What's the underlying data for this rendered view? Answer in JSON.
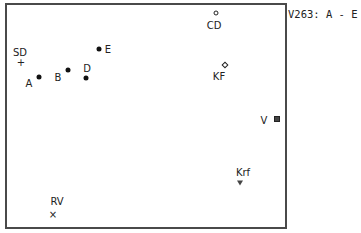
{
  "chart_data": {
    "type": "scatter",
    "title": "V263: A - E",
    "xlabel": "",
    "ylabel": "",
    "grid": false,
    "legend": "none",
    "axes_ticks": "none",
    "points": [
      {
        "label": "SD",
        "marker": "plus",
        "px": [
          21,
          63
        ],
        "label_px": [
          20,
          53
        ]
      },
      {
        "label": "A",
        "marker": "dot",
        "px": [
          39,
          77
        ],
        "label_px": [
          29,
          84
        ]
      },
      {
        "label": "B",
        "marker": "dot",
        "px": [
          68,
          70
        ],
        "label_px": [
          58,
          78
        ]
      },
      {
        "label": "D",
        "marker": "dot",
        "px": [
          86,
          78
        ],
        "label_px": [
          87,
          69
        ]
      },
      {
        "label": "E",
        "marker": "dot",
        "px": [
          99,
          49
        ],
        "label_px": [
          108,
          50
        ]
      },
      {
        "label": "CD",
        "marker": "circle",
        "px": [
          216,
          13
        ],
        "label_px": [
          214,
          26
        ]
      },
      {
        "label": "KF",
        "marker": "diamond",
        "px": [
          225,
          65
        ],
        "label_px": [
          219,
          77
        ]
      },
      {
        "label": "V",
        "marker": "square",
        "px": [
          277,
          119
        ],
        "label_px": [
          264,
          121
        ]
      },
      {
        "label": "Krf",
        "marker": "triangle",
        "px": [
          240,
          183
        ],
        "label_px": [
          243,
          173
        ]
      },
      {
        "label": "RV",
        "marker": "cross",
        "px": [
          53,
          215
        ],
        "label_px": [
          57,
          202
        ]
      }
    ]
  },
  "glyphs": {
    "plus": "+",
    "cross": "×"
  }
}
